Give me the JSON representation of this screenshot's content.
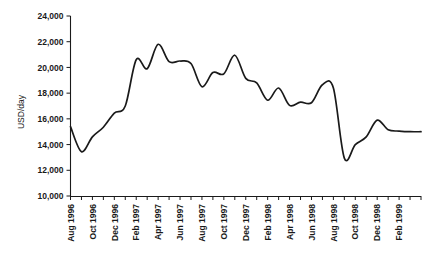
{
  "chart_data": {
    "type": "line",
    "title": "",
    "xlabel": "",
    "ylabel": "USD/day",
    "ylim": [
      10000,
      24000
    ],
    "y_ticks": [
      10000,
      12000,
      14000,
      16000,
      18000,
      20000,
      22000,
      24000
    ],
    "y_tick_labels": [
      "10,000",
      "12,000",
      "14,000",
      "16,000",
      "18,000",
      "20,000",
      "22,000",
      "24,000"
    ],
    "grid": false,
    "legend": "none",
    "line_color": "#1a1a1a",
    "x_tick_labels": [
      "Aug 1996",
      "Oct 1996",
      "Dec 1996",
      "Feb 1997",
      "Apr 1997",
      "Jun 1997",
      "Aug 1997",
      "Oct 1997",
      "Dec 1997",
      "Feb 1998",
      "Apr 1998",
      "Jun 1998",
      "Aug 1998",
      "Oct 1998",
      "Dec 1998",
      "Feb 1999"
    ],
    "x": [
      "Aug 1996",
      "Sep 1996",
      "Oct 1996",
      "Nov 1996",
      "Dec 1996",
      "Jan 1997",
      "Feb 1997",
      "Mar 1997",
      "Apr 1997",
      "May 1997",
      "Jun 1997",
      "Jul 1997",
      "Aug 1997",
      "Sep 1997",
      "Oct 1997",
      "Nov 1997",
      "Dec 1997",
      "Jan 1998",
      "Feb 1998",
      "Mar 1998",
      "Apr 1998",
      "May 1998",
      "Jun 1998",
      "Jul 1998",
      "Aug 1998",
      "Sep 1998",
      "Oct 1998",
      "Nov 1998",
      "Dec 1998",
      "Jan 1999",
      "Feb 1999",
      "Mar 1999",
      "Apr 1999"
    ],
    "values": [
      15400,
      13450,
      14600,
      15350,
      16450,
      17000,
      20600,
      19900,
      21800,
      20450,
      20500,
      20300,
      18500,
      19600,
      19500,
      20950,
      19150,
      18800,
      17450,
      18400,
      17050,
      17300,
      17250,
      18650,
      18400,
      12950,
      14000,
      14600,
      15900,
      15150,
      15050,
      15000,
      15000
    ],
    "series_name": "USD/day rate"
  },
  "axes": {
    "y_axis_title": "USD/day"
  }
}
